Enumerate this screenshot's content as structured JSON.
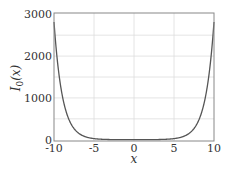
{
  "chart_data": {
    "type": "line",
    "title": "",
    "xlabel": "x",
    "ylabel": "I_0(x)",
    "ylabel_main": "I",
    "ylabel_sub": "0",
    "ylabel_arg": "(x)",
    "xlim": [
      -10,
      10
    ],
    "ylim": [
      -30,
      3030
    ],
    "grid": true,
    "x_ticks": [
      -10,
      -5,
      0,
      5,
      10
    ],
    "x_tick_labels": [
      "-10",
      "-5",
      "0",
      "5",
      "10"
    ],
    "y_ticks": [
      0,
      1000,
      2000,
      3000
    ],
    "y_tick_labels": [
      "0",
      "1000",
      "2000",
      "3000"
    ],
    "y_grid": [
      500,
      1000,
      1500,
      2000,
      2500
    ],
    "x_grid": [
      -5,
      0,
      5
    ],
    "series": [
      {
        "name": "I_0(x)",
        "color": "#555555",
        "x": [
          -10,
          -9.5,
          -9,
          -8.5,
          -8,
          -7.5,
          -7,
          -6.5,
          -6,
          -5.5,
          -5,
          -4.5,
          -4,
          -3,
          -2,
          -1,
          0,
          1,
          2,
          3,
          4,
          4.5,
          5,
          5.5,
          6,
          6.5,
          7,
          7.5,
          8,
          8.5,
          9,
          9.5,
          10
        ],
        "values": [
          2815.7,
          1725.2,
          1094,
          676.9,
          427.6,
          270.9,
          168.6,
          106.5,
          67.2,
          42.7,
          27.2,
          17.5,
          11.3,
          4.88,
          2.28,
          1.27,
          1,
          1.27,
          2.28,
          4.88,
          11.3,
          17.5,
          27.2,
          42.7,
          67.2,
          106.5,
          168.6,
          270.9,
          427.6,
          676.9,
          1094,
          1725.2,
          2815.7
        ]
      }
    ]
  },
  "colors": {
    "frame": "#888888",
    "grid": "#dddddd",
    "line": "#555555"
  }
}
